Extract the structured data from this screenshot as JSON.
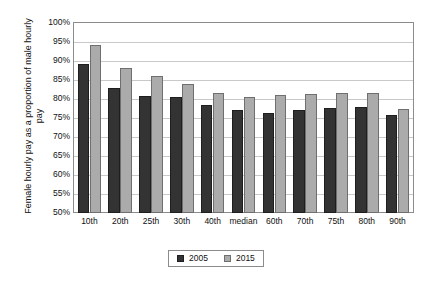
{
  "chart_data": {
    "type": "bar",
    "title": "",
    "xlabel": "",
    "ylabel": "Female hourly pay as a proportion of male hourly pay",
    "ylim": [
      50,
      100
    ],
    "ytick_format": "percent",
    "yticks": [
      50,
      55,
      60,
      65,
      70,
      75,
      80,
      85,
      90,
      95,
      100
    ],
    "ytick_labels": [
      "50%",
      "55%",
      "60%",
      "65%",
      "70%",
      "75%",
      "80%",
      "85%",
      "90%",
      "95%",
      "100%"
    ],
    "grid": true,
    "grid_axis": "y",
    "legend_position": "bottom",
    "categories": [
      "10th",
      "20th",
      "25th",
      "30th",
      "40th",
      "median",
      "60th",
      "70th",
      "75th",
      "80th",
      "90th"
    ],
    "series": [
      {
        "name": "2005",
        "color": "#333333",
        "values": [
          89.1,
          82.8,
          80.9,
          80.4,
          78.4,
          77.1,
          76.4,
          77.0,
          77.6,
          77.9,
          75.7
        ]
      },
      {
        "name": "2015",
        "color": "#ababab",
        "values": [
          94.3,
          88.1,
          86.1,
          84.0,
          81.7,
          80.5,
          81.0,
          81.3,
          81.7,
          81.7,
          77.4
        ]
      }
    ]
  },
  "legend": {
    "entries": [
      {
        "label": "2005"
      },
      {
        "label": "2015"
      }
    ]
  }
}
